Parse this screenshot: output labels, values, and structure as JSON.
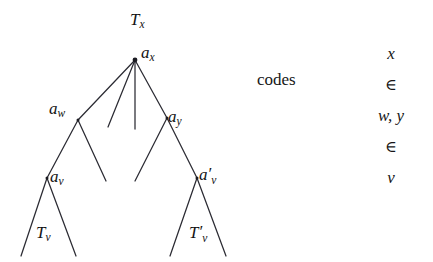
{
  "figure": {
    "background_color": "#ffffff",
    "line_color": "#2b2b33",
    "text_color": "#141414"
  },
  "tree": {
    "labels": {
      "root_subtree": {
        "base": "T",
        "sub": "x",
        "prime": ""
      },
      "root_node": {
        "base": "a",
        "sub": "x",
        "prime": ""
      },
      "left_child": {
        "base": "a",
        "sub": "w",
        "prime": ""
      },
      "right_child": {
        "base": "a",
        "sub": "y",
        "prime": ""
      },
      "left_grandchild": {
        "base": "a",
        "sub": "v",
        "prime": ""
      },
      "right_grandchild": {
        "base": "a",
        "sub": "v",
        "prime": "′"
      },
      "left_leaf_subtree": {
        "base": "T",
        "sub": "v",
        "prime": ""
      },
      "right_leaf_subtree": {
        "base": "T",
        "sub": "v",
        "prime": "′"
      }
    },
    "nodes": [
      {
        "id": "ax",
        "x": 135,
        "y": 60
      },
      {
        "id": "aw",
        "x": 78,
        "y": 120
      },
      {
        "id": "ay",
        "x": 167,
        "y": 118
      },
      {
        "id": "av",
        "x": 47,
        "y": 178
      },
      {
        "id": "avp",
        "x": 197,
        "y": 178
      }
    ],
    "edges": [
      {
        "from": [
          135,
          60
        ],
        "to": [
          78,
          120
        ]
      },
      {
        "from": [
          135,
          60
        ],
        "to": [
          108,
          127
        ]
      },
      {
        "from": [
          135,
          60
        ],
        "to": [
          135,
          129
        ]
      },
      {
        "from": [
          135,
          60
        ],
        "to": [
          167,
          118
        ]
      },
      {
        "from": [
          78,
          120
        ],
        "to": [
          47,
          178
        ]
      },
      {
        "from": [
          78,
          120
        ],
        "to": [
          106,
          181
        ]
      },
      {
        "from": [
          167,
          118
        ],
        "to": [
          135,
          181
        ]
      },
      {
        "from": [
          167,
          118
        ],
        "to": [
          197,
          178
        ]
      },
      {
        "from": [
          47,
          178
        ],
        "to": [
          21,
          256
        ]
      },
      {
        "from": [
          47,
          178
        ],
        "to": [
          76,
          256
        ]
      },
      {
        "from": [
          197,
          178
        ],
        "to": [
          170,
          256
        ]
      },
      {
        "from": [
          197,
          178
        ],
        "to": [
          226,
          256
        ]
      }
    ]
  },
  "annotation": {
    "codes_label": "codes",
    "codes_column": [
      {
        "text": "x",
        "style": "italic"
      },
      {
        "text": "∈",
        "style": "symbol"
      },
      {
        "text": "w, y",
        "style": "italic"
      },
      {
        "text": "∈",
        "style": "symbol"
      },
      {
        "text": "v",
        "style": "italic"
      }
    ]
  }
}
